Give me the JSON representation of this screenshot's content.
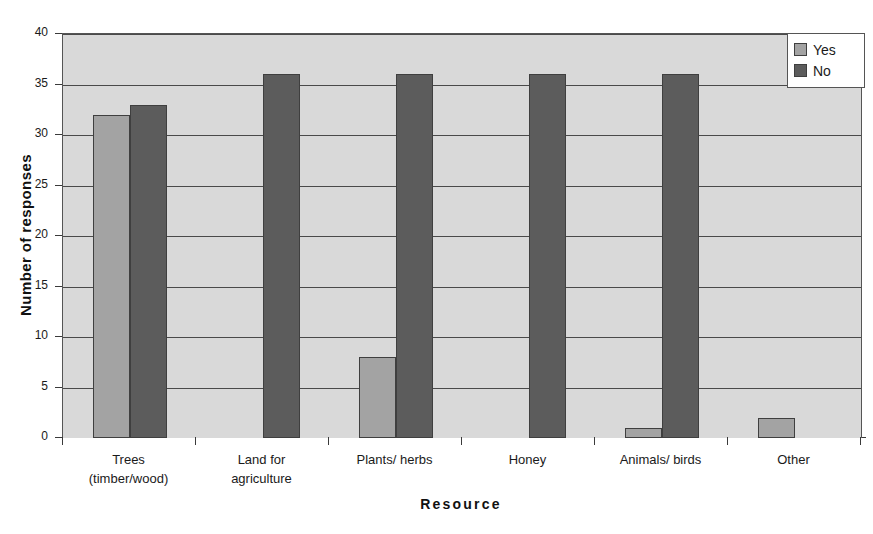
{
  "chart_data": {
    "type": "bar",
    "title": "",
    "subtitle": "",
    "xlabel": "Resource",
    "ylabel": "Number of responses",
    "categories": [
      "Trees\n(timber/wood)",
      "Land for\nagriculture",
      "Plants/ herbs",
      "Honey",
      "Animals/ birds",
      "Other"
    ],
    "category_lines": [
      [
        "Trees",
        "(timber/wood)"
      ],
      [
        "Land for",
        "agriculture"
      ],
      [
        "Plants/ herbs"
      ],
      [
        "Honey"
      ],
      [
        "Animals/ birds"
      ],
      [
        "Other"
      ]
    ],
    "series": [
      {
        "name": "Yes",
        "color": "#a3a3a3",
        "values": [
          32,
          0,
          8,
          0,
          1,
          2
        ]
      },
      {
        "name": "No",
        "color": "#5c5c5c",
        "values": [
          33,
          36,
          36,
          36,
          36,
          0
        ]
      }
    ],
    "ylim": [
      0,
      40
    ],
    "yticks": [
      0,
      5,
      10,
      15,
      20,
      25,
      30,
      35,
      40
    ],
    "ytick_labels": [
      "0",
      "5",
      "10",
      "15",
      "20",
      "25",
      "30",
      "35",
      "40"
    ],
    "grid": true,
    "grid_axis": "y",
    "legend_position": "top-right",
    "plot_background": "#d9d9d9",
    "figure_background": "#ffffff"
  },
  "legend": {
    "entries": [
      {
        "label": "Yes",
        "color": "#a3a3a3"
      },
      {
        "label": "No",
        "color": "#5c5c5c"
      }
    ]
  }
}
